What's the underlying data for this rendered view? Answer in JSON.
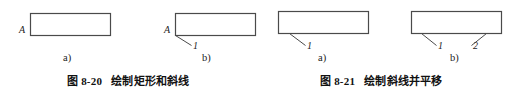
{
  "page": {
    "width": 523,
    "height": 90,
    "background": "#ffffff",
    "line_color": "#4a4a4a",
    "text_color": "#1c1c1c"
  },
  "figures": [
    {
      "id": "fig-8-20",
      "caption_number": "图 8-20",
      "caption_text": "绘制矩形和斜线",
      "subfigures": [
        {
          "id": "fig-8-20-a",
          "label": "a)",
          "rect": {
            "x": 30,
            "y": 13,
            "width": 80,
            "height": 22
          },
          "point_labels": [
            {
              "name": "A",
              "text": "A",
              "x": 19,
              "y": 29
            }
          ],
          "leader_lines": []
        },
        {
          "id": "fig-8-20-b",
          "label": "b)",
          "rect": {
            "x": 175,
            "y": 13,
            "width": 80,
            "height": 22
          },
          "point_labels": [
            {
              "name": "A",
              "text": "A",
              "x": 164,
              "y": 29
            },
            {
              "name": "1",
              "text": "1",
              "x": 193,
              "y": 44
            }
          ],
          "leader_lines": [
            {
              "name": "slash-1",
              "x1": 175,
              "y1": 35,
              "x2": 191,
              "y2": 45
            }
          ]
        }
      ]
    },
    {
      "id": "fig-8-21",
      "caption_number": "图 8-21",
      "caption_text": "绘制斜线并平移",
      "subfigures": [
        {
          "id": "fig-8-21-a",
          "label": "a)",
          "rect": {
            "x": 278,
            "y": 11,
            "width": 90,
            "height": 22
          },
          "point_labels": [
            {
              "name": "1",
              "text": "1",
              "x": 307,
              "y": 44
            }
          ],
          "leader_lines": [
            {
              "name": "slash-1",
              "x1": 289,
              "y1": 33,
              "x2": 305,
              "y2": 45
            }
          ]
        },
        {
          "id": "fig-8-21-b",
          "label": "b)",
          "rect": {
            "x": 411,
            "y": 11,
            "width": 90,
            "height": 22
          },
          "point_labels": [
            {
              "name": "1",
              "text": "1",
              "x": 438,
              "y": 44
            },
            {
              "name": "2",
              "text": "2",
              "x": 473,
              "y": 44
            }
          ],
          "leader_lines": [
            {
              "name": "slash-1",
              "x1": 421,
              "y1": 33,
              "x2": 436,
              "y2": 45
            },
            {
              "name": "slash-2",
              "x1": 486,
              "y1": 33,
              "x2": 471,
              "y2": 45
            }
          ]
        }
      ]
    }
  ],
  "sublabels": [
    {
      "name": "sublabel-8-20-a",
      "text": "a)",
      "x": 63,
      "y": 53
    },
    {
      "name": "sublabel-8-20-b",
      "text": "b)",
      "x": 202,
      "y": 53
    },
    {
      "name": "sublabel-8-21-a",
      "text": "a)",
      "x": 318,
      "y": 53
    },
    {
      "name": "sublabel-8-21-b",
      "text": "b)",
      "x": 450,
      "y": 53
    }
  ],
  "captions": [
    {
      "name": "caption-8-20",
      "number": "图 8-20",
      "text": "绘制矩形和斜线",
      "x": 67,
      "y": 72
    },
    {
      "name": "caption-8-21",
      "number": "图 8-21",
      "text": "绘制斜线并平移",
      "x": 320,
      "y": 72
    }
  ]
}
